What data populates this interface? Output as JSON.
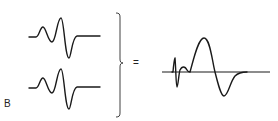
{
  "figure": {
    "panel_label": "B",
    "operator": "=",
    "colors": {
      "stroke": "#1a1a1a",
      "background": "#ffffff"
    },
    "components": [
      {
        "name": "waveform-1",
        "description": "biphasic oscillating wave (small positive hump, sharp positive peak, deep negative trough, flat tail)"
      },
      {
        "name": "waveform-2",
        "description": "identical biphasic oscillating wave"
      }
    ],
    "result": {
      "name": "summed-waveform",
      "description": "small early spike followed by large positive peak and negative trough on horizontal baseline"
    }
  }
}
